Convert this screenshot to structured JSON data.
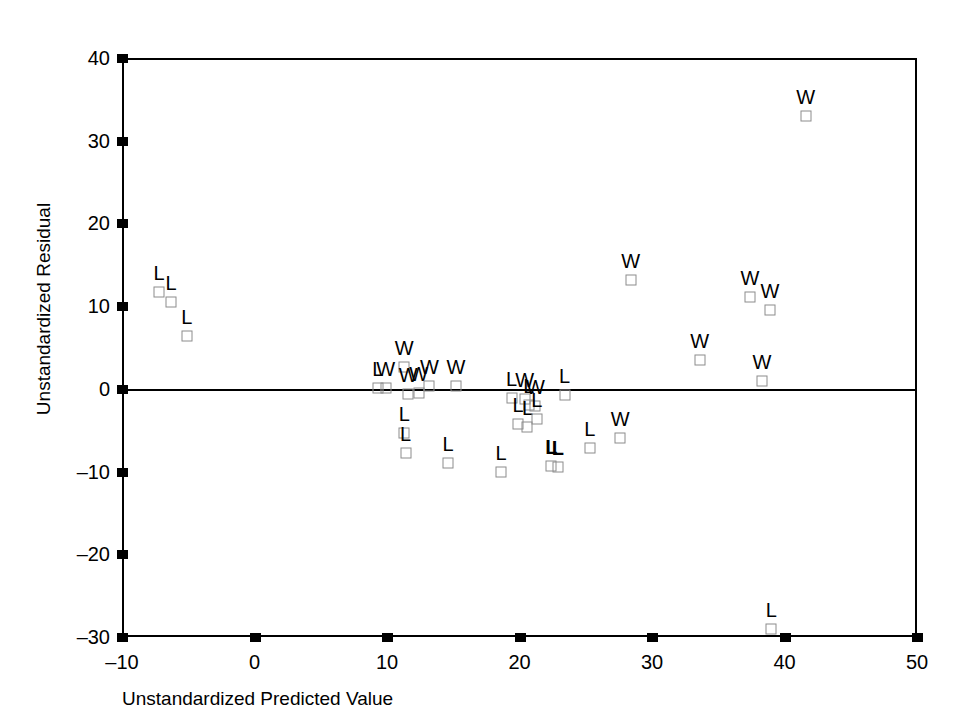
{
  "chart_data": {
    "type": "scatter",
    "title": "",
    "xlabel": "Unstandardized Predicted Value",
    "ylabel": "Unstandardized Residual",
    "xlim": [
      -10,
      50
    ],
    "ylim": [
      -30,
      40
    ],
    "xticks": [
      -10,
      0,
      10,
      20,
      30,
      40,
      50
    ],
    "yticks": [
      -30,
      -20,
      -10,
      0,
      10,
      20,
      30,
      40
    ],
    "xtick_labels": [
      "–10",
      "0",
      "10",
      "20",
      "30",
      "40",
      "50"
    ],
    "ytick_labels": [
      "–30",
      "–20",
      "–10",
      "0",
      "10",
      "20",
      "30",
      "40"
    ],
    "grid": false,
    "legend": "none",
    "reference_line_y": 0,
    "marker": "open-square",
    "marker_color": "#8c8c8c",
    "point_label_groups": [
      "W",
      "L"
    ],
    "points": [
      {
        "x": -7.2,
        "y": 11.7,
        "label": "L"
      },
      {
        "x": -6.3,
        "y": 10.5,
        "label": "L"
      },
      {
        "x": -5.1,
        "y": 6.4,
        "label": "L"
      },
      {
        "x": 9.3,
        "y": 0.1,
        "label": "L"
      },
      {
        "x": 9.9,
        "y": 0.1,
        "label": "W"
      },
      {
        "x": 11.3,
        "y": 2.7,
        "label": "W"
      },
      {
        "x": 11.6,
        "y": -0.6,
        "label": "W"
      },
      {
        "x": 12.4,
        "y": -0.5,
        "label": "W"
      },
      {
        "x": 13.2,
        "y": 0.4,
        "label": "W"
      },
      {
        "x": 15.2,
        "y": 0.4,
        "label": "W"
      },
      {
        "x": 11.3,
        "y": -5.3,
        "label": "L"
      },
      {
        "x": 11.4,
        "y": -7.7,
        "label": "L"
      },
      {
        "x": 14.6,
        "y": -9.0,
        "label": "L"
      },
      {
        "x": 18.6,
        "y": -10.1,
        "label": "L"
      },
      {
        "x": 19.4,
        "y": -1.1,
        "label": "L"
      },
      {
        "x": 20.4,
        "y": -1.2,
        "label": "W"
      },
      {
        "x": 20.7,
        "y": -1.9,
        "label": "L"
      },
      {
        "x": 21.2,
        "y": -2.1,
        "label": "W"
      },
      {
        "x": 19.9,
        "y": -4.3,
        "label": "L"
      },
      {
        "x": 20.6,
        "y": -4.6,
        "label": "L"
      },
      {
        "x": 21.3,
        "y": -3.6,
        "label": "L"
      },
      {
        "x": 22.4,
        "y": -9.3,
        "label": "L"
      },
      {
        "x": 22.9,
        "y": -9.4,
        "label": "L"
      },
      {
        "x": 23.4,
        "y": -0.7,
        "label": "L"
      },
      {
        "x": 25.3,
        "y": -7.2,
        "label": "L"
      },
      {
        "x": 27.6,
        "y": -5.9,
        "label": "W"
      },
      {
        "x": 28.4,
        "y": 13.2,
        "label": "W"
      },
      {
        "x": 33.6,
        "y": 3.5,
        "label": "W"
      },
      {
        "x": 37.4,
        "y": 11.1,
        "label": "W"
      },
      {
        "x": 38.9,
        "y": 9.5,
        "label": "W"
      },
      {
        "x": 38.3,
        "y": 0.9,
        "label": "W"
      },
      {
        "x": 39.0,
        "y": -29.0,
        "label": "L"
      },
      {
        "x": 41.6,
        "y": 33.0,
        "label": "W"
      }
    ]
  }
}
